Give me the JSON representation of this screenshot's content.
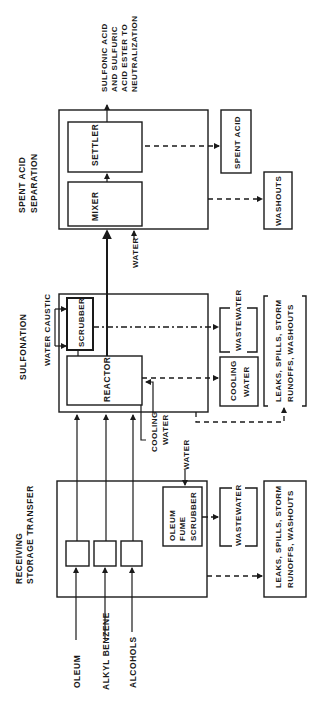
{
  "diagram": {
    "orientation": "rotated-90-ccw",
    "sections": {
      "receiving": {
        "title_line1": "RECEIVING",
        "title_line2": "STORAGE TRANSFER"
      },
      "sulfonation": {
        "title": "SULFONATION",
        "subtitle": "WATER CAUSTIC"
      },
      "spent_acid": {
        "title_line1": "SPENT ACID",
        "title_line2": "SEPARATION"
      }
    },
    "inputs": {
      "oleum": "OLEUM",
      "alkyl_benzene": "ALKYL BENZENE",
      "alcohols": "ALCOHOLS",
      "cooling_water_line1": "COOLING",
      "cooling_water_line2": "WATER",
      "water_receiving": "WATER",
      "water_spent_acid": "WATER"
    },
    "units": {
      "oleum_fume_scrubber_line1": "OLEUM",
      "oleum_fume_scrubber_line2": "FUME",
      "oleum_fume_scrubber_line3": "SCRUBBER",
      "scrubber": "SCRUBBER",
      "reactor": "REACTOR",
      "mixer": "MIXER",
      "settler": "SETTLER"
    },
    "outputs": {
      "product_line1": "SULFONIC ACID",
      "product_line2": "AND SULFURIC",
      "product_line3": "ACID ESTER TO",
      "product_line4": "NEUTRALIZATION",
      "spent_acid": "SPENT ACID",
      "washouts": "WASHOUTS",
      "wastewater_receiving": "WASTEWATER",
      "wastewater_sulfonation": "WASTEWATER",
      "cooling_water_out_line1": "COOLING",
      "cooling_water_out_line2": "WATER",
      "leaks_receiving_line1": "LEAKS, SPILLS, STORM",
      "leaks_receiving_line2": "RUNOFFS, WASHOUTS",
      "leaks_sulfonation_line1": "LEAKS, SPILLS, STORM",
      "leaks_sulfonation_line2": "RUNOFFS, WASHOUTS"
    }
  }
}
